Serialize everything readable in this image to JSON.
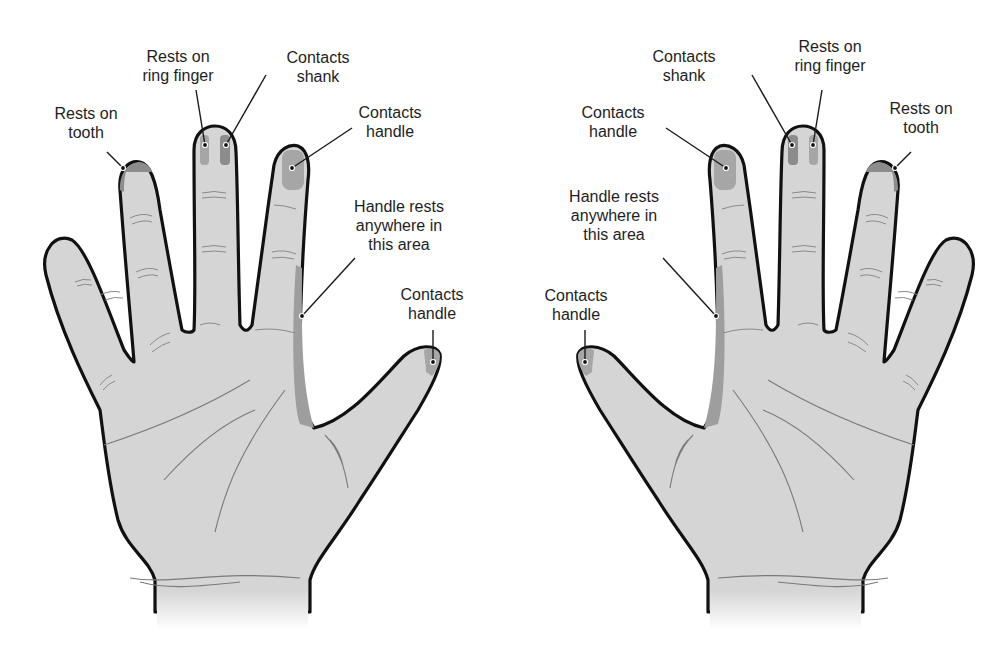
{
  "figure": {
    "colors": {
      "skin": "#d5d5d5",
      "outline": "#111111",
      "contact_area_dark": "#8c8c8c",
      "contact_area_medium": "#a6a6a6",
      "handle_rest_area": "#9e9e9e"
    },
    "left_hand": {
      "labels": {
        "rests_on_tooth": {
          "line1": "Rests on",
          "line2": "tooth"
        },
        "rests_on_ring_finger": {
          "line1": "Rests on",
          "line2": "ring finger"
        },
        "contacts_shank": {
          "line1": "Contacts",
          "line2": "shank"
        },
        "contacts_handle_index": {
          "line1": "Contacts",
          "line2": "handle"
        },
        "handle_rests_area": {
          "line1": "Handle rests",
          "line2": "anywhere in",
          "line3": "this area"
        },
        "contacts_handle_thumb": {
          "line1": "Contacts",
          "line2": "handle"
        }
      }
    },
    "right_hand": {
      "labels": {
        "contacts_shank": {
          "line1": "Contacts",
          "line2": "shank"
        },
        "rests_on_ring_finger": {
          "line1": "Rests on",
          "line2": "ring finger"
        },
        "rests_on_tooth": {
          "line1": "Rests on",
          "line2": "tooth"
        },
        "contacts_handle_index": {
          "line1": "Contacts",
          "line2": "handle"
        },
        "handle_rests_area": {
          "line1": "Handle rests",
          "line2": "anywhere in",
          "line3": "this area"
        },
        "contacts_handle_thumb": {
          "line1": "Contacts",
          "line2": "handle"
        }
      }
    }
  }
}
